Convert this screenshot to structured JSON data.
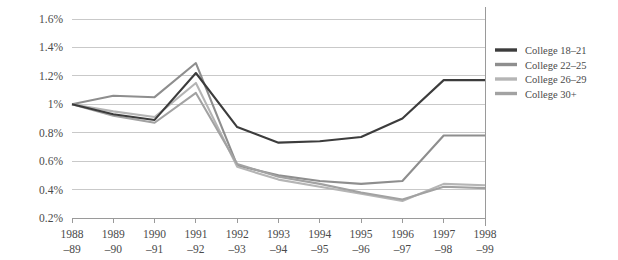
{
  "chart_data": {
    "type": "line",
    "title": "",
    "xlabel": "",
    "ylabel": "",
    "categories": [
      "1988–89",
      "1989–90",
      "1990–91",
      "1991–92",
      "1992–93",
      "1993–94",
      "1994–95",
      "1995–96",
      "1996–97",
      "1997–98",
      "1998–99"
    ],
    "category_lines": [
      [
        "1988",
        "–89"
      ],
      [
        "1989",
        "–90"
      ],
      [
        "1990",
        "–91"
      ],
      [
        "1991",
        "–92"
      ],
      [
        "1992",
        "–93"
      ],
      [
        "1993",
        "–94"
      ],
      [
        "1994",
        "–95"
      ],
      [
        "1995",
        "–96"
      ],
      [
        "1996",
        "–97"
      ],
      [
        "1997",
        "–98"
      ],
      [
        "1998",
        "–99"
      ]
    ],
    "series": [
      {
        "name": "College 18–21",
        "color": "#3c3c3c",
        "values": [
          1.0,
          0.93,
          0.89,
          1.22,
          0.84,
          0.73,
          0.74,
          0.77,
          0.9,
          1.17,
          1.17
        ]
      },
      {
        "name": "College 22–25",
        "color": "#8e8e8e",
        "values": [
          1.0,
          1.06,
          1.05,
          1.29,
          0.57,
          0.5,
          0.46,
          0.44,
          0.46,
          0.78,
          0.78
        ]
      },
      {
        "name": "College 26–29",
        "color": "#b5b5b5",
        "values": [
          1.0,
          0.95,
          0.91,
          1.15,
          0.56,
          0.47,
          0.42,
          0.37,
          0.32,
          0.44,
          0.43
        ]
      },
      {
        "name": "College 30+",
        "color": "#a2a2a2",
        "values": [
          1.0,
          0.92,
          0.87,
          1.08,
          0.58,
          0.49,
          0.44,
          0.38,
          0.33,
          0.42,
          0.41
        ]
      }
    ],
    "ylim": [
      0.2,
      1.6
    ],
    "yticks": [
      0.2,
      0.4,
      0.6,
      0.8,
      1.0,
      1.2,
      1.4,
      1.6
    ],
    "ytick_labels": [
      "0.2%",
      "0.4%",
      "0.6%",
      "0.8%",
      "1%",
      "1.2%",
      "1.4%",
      "1.6%"
    ],
    "grid": true,
    "legend_position": "right"
  },
  "legend": {
    "entries": [
      {
        "label": "College 18–21"
      },
      {
        "label": "College 22–25"
      },
      {
        "label": "College 26–29"
      },
      {
        "label": "College 30+"
      }
    ]
  }
}
